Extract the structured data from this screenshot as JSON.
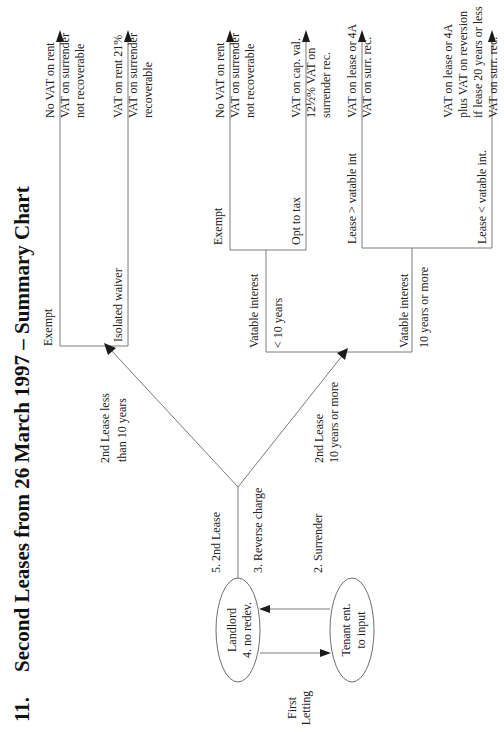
{
  "title": {
    "number": "11.",
    "text": "Second Leases from 26 March 1997 – Summary Chart"
  },
  "nodes": {
    "landlord": {
      "line1": "Landlord",
      "line2": "4. no redev."
    },
    "tenant": {
      "line1": "Tenant ent.",
      "line2": "to input"
    },
    "first_letting": {
      "line1": "First",
      "line2": "Letting"
    }
  },
  "steps": {
    "second_lease": "5. 2nd Lease",
    "reverse_charge": "3. Reverse charge",
    "surrender": "2. Surrender"
  },
  "branches": {
    "less_than_10": {
      "line1": "2nd Lease less",
      "line2": "than 10 years"
    },
    "ten_or_more": {
      "line1": "2nd Lease",
      "line2": "10 years or more"
    }
  },
  "decisions": {
    "short_exempt": "Exempt",
    "short_isolated_waiver": "Isolated waiver",
    "vatable_lt10_line1": "Vatable interest",
    "vatable_lt10_line2": "< 10 years",
    "vatable_lt10_exempt": "Exempt",
    "vatable_lt10_opt": "Opt to tax",
    "vatable_ge10_line1": "Vatable interest",
    "vatable_ge10_line2": "10 years or more",
    "lease_gt_vatable": "Lease > vatable int",
    "lease_lt_vatable": "Lease < vatable int."
  },
  "outcomes": [
    {
      "lines": [
        "No VAT on rent",
        "VAT on surrender",
        "not recoverable"
      ]
    },
    {
      "lines": [
        "VAT on rent 21%",
        "VAT on surrender",
        "recoverable"
      ]
    },
    {
      "lines": [
        "No VAT on rent",
        "VAT on surrender",
        "not recoverable"
      ]
    },
    {
      "lines": [
        "VAT on cap. val.",
        "12½% VAT on",
        "surrender rec."
      ]
    },
    {
      "lines": [
        "VAT on lease or 4A",
        "VAT on surr. rec."
      ]
    },
    {
      "lines": [
        "VAT on lease or 4A",
        "plus VAT on reversion",
        "if lease 20 years or less",
        "VAT on surr. rec."
      ]
    }
  ],
  "colors": {
    "line": "#7a7a7a",
    "text": "#222222",
    "arrowhead": "#1a1a1a",
    "background": "#ffffff"
  }
}
